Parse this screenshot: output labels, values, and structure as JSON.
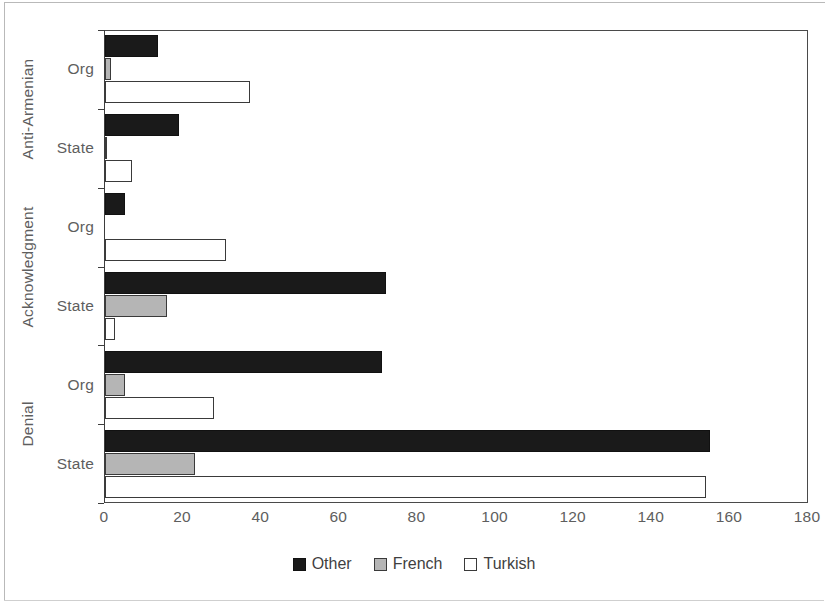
{
  "chart_data": {
    "type": "bar",
    "orientation": "horizontal",
    "title": "",
    "xlabel": "",
    "ylabel": "",
    "xlim": [
      0,
      180
    ],
    "xticks": [
      0,
      20,
      40,
      60,
      80,
      100,
      120,
      140,
      160,
      180
    ],
    "grid": false,
    "legend_position": "bottom-center",
    "group_labels": [
      "Anti-Armenian",
      "Acknowledgment",
      "Denial"
    ],
    "categories": [
      "Anti-Armenian Org",
      "Anti-Armenian State",
      "Acknowledgment Org",
      "Acknowledgment State",
      "Denial Org",
      "Denial State"
    ],
    "subcategories": [
      "Org",
      "State",
      "Org",
      "State",
      "Org",
      "State"
    ],
    "series": [
      {
        "name": "Other",
        "color": "#1a1a1a",
        "values": [
          13.5,
          19,
          5,
          72,
          71,
          155
        ]
      },
      {
        "name": "French",
        "color": "#b5b5b5",
        "values": [
          1.5,
          0.5,
          0,
          16,
          5,
          23
        ]
      },
      {
        "name": "Turkish",
        "color": "#ffffff",
        "values": [
          37,
          7,
          31,
          2.5,
          28,
          154
        ]
      }
    ]
  },
  "axis": {
    "x_tick_labels": [
      "0",
      "20",
      "40",
      "60",
      "80",
      "100",
      "120",
      "140",
      "160",
      "180"
    ],
    "y_tick_labels": [
      "Org",
      "State",
      "Org",
      "State",
      "Org",
      "State"
    ],
    "group_labels": [
      "Anti-Armenian",
      "Acknowledgment",
      "Denial"
    ]
  },
  "legend": {
    "items": [
      {
        "label": "Other",
        "swatch": "other"
      },
      {
        "label": "French",
        "swatch": "french"
      },
      {
        "label": "Turkish",
        "swatch": "turkish"
      }
    ]
  }
}
